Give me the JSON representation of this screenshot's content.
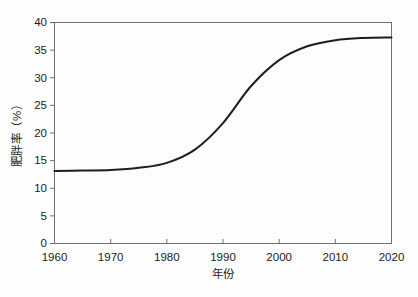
{
  "figure": {
    "background": "#fdfdfd",
    "plot_background": "#fdfdfd"
  },
  "chart_data": {
    "type": "line",
    "title": "",
    "xlabel": "年份",
    "ylabel": "肥胖率（%）",
    "xlim": [
      1960,
      2020
    ],
    "ylim": [
      0,
      40
    ],
    "x_ticks": [
      1960,
      1970,
      1980,
      1990,
      2000,
      2010,
      2020
    ],
    "y_ticks": [
      0,
      5,
      10,
      15,
      20,
      25,
      30,
      35,
      40
    ],
    "grid": false,
    "legend": "none",
    "frame": "full-box",
    "axis_color": "#707070",
    "tick_label_color": "#1c1c1c",
    "tick_font_size": 10.5,
    "series": [
      {
        "name": "肥胖率",
        "color": "#1e1e1e",
        "stroke_width": 2,
        "x": [
          1960,
          1965,
          1970,
          1975,
          1980,
          1985,
          1990,
          1995,
          2000,
          2005,
          2010,
          2015,
          2020
        ],
        "y": [
          13.1,
          13.2,
          13.3,
          13.7,
          14.6,
          17.0,
          21.8,
          28.5,
          33.2,
          35.7,
          36.8,
          37.2,
          37.3
        ]
      }
    ]
  }
}
